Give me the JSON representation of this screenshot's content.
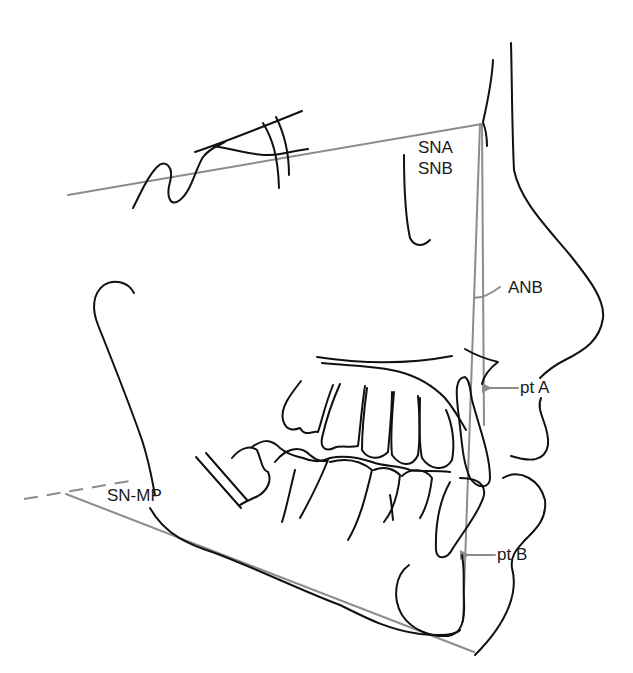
{
  "diagram": {
    "type": "cephalometric tracing (lateral skull / facial profile)",
    "colors": {
      "anatomy_stroke": "#111111",
      "reference_line_stroke": "#8c8c8c",
      "background": "#ffffff"
    },
    "labels": {
      "sna": "SNA",
      "snb": "SNB",
      "anb": "ANB",
      "pt_a": "pt A",
      "pt_b": "pt B",
      "sn_mp": "SN-MP"
    },
    "reference_lines": [
      {
        "name": "S-N line",
        "from": [
          68,
          195
        ],
        "to": [
          482,
          125
        ]
      },
      {
        "name": "N-A line",
        "from": [
          482,
          125
        ],
        "to": [
          484,
          425
        ]
      },
      {
        "name": "N-B line",
        "from": [
          482,
          125
        ],
        "to": [
          463,
          620
        ]
      },
      {
        "name": "Mandibular plane",
        "from": [
          66,
          493
        ],
        "to": [
          474,
          652
        ]
      },
      {
        "name": "S-N extension (dashed)",
        "from": [
          24,
          500
        ],
        "to": [
          128,
          482
        ]
      }
    ],
    "arrows": [
      {
        "target": "pt A",
        "label": "pt A"
      },
      {
        "target": "pt B",
        "label": "pt B"
      }
    ]
  }
}
